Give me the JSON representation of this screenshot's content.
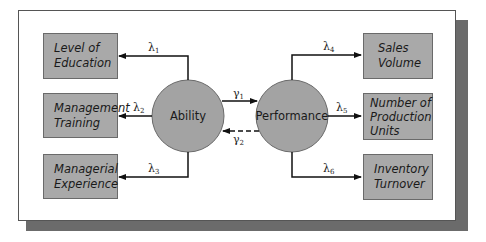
{
  "diagram": {
    "latent": {
      "ability": "Ability",
      "performance": "Performance"
    },
    "indicators_left": [
      {
        "line1": "Level of",
        "line2": "Education",
        "loading": "λ",
        "sub": "1"
      },
      {
        "line1": "Management",
        "line2": "Training",
        "loading": "λ",
        "sub": "2"
      },
      {
        "line1": "Managerial",
        "line2": "Experience",
        "loading": "λ",
        "sub": "3"
      }
    ],
    "indicators_right": [
      {
        "line1": "Sales",
        "line2": "Volume",
        "line3": "",
        "loading": "λ",
        "sub": "4"
      },
      {
        "line1": "Number of",
        "line2": "Production",
        "line3": "Units",
        "loading": "λ",
        "sub": "5"
      },
      {
        "line1": "Inventory",
        "line2": "Turnover",
        "line3": "",
        "loading": "λ",
        "sub": "6"
      }
    ],
    "paths": {
      "gamma1": {
        "sym": "γ",
        "sub": "1",
        "style": "solid",
        "from": "Ability",
        "to": "Performance"
      },
      "gamma2": {
        "sym": "γ",
        "sub": "2",
        "style": "dashed",
        "from": "Performance",
        "to": "Ability"
      }
    },
    "colors": {
      "box_fill": "#a9a9a9",
      "circle_fill": "#a3a3a3",
      "shadow": "#6b6b6b",
      "line": "#111111"
    }
  }
}
